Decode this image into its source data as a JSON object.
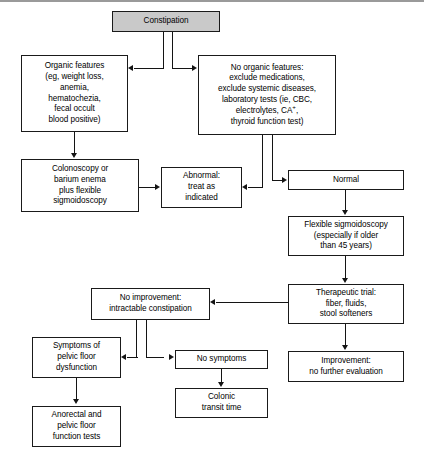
{
  "diagram": {
    "nodes": {
      "constipation": "Constipation",
      "organic_features": "Organic features\n(eg, weight loss,\nanemia,\nhematochezia,\nfecal occult\nblood positive)",
      "no_organic_features_l1": "No organic features:",
      "no_organic_features_l2": "exclude medications,",
      "no_organic_features_l3": "exclude systemic diseases,",
      "no_organic_features_l4": "laboratory tests (ie, CBC,",
      "no_organic_features_l5a": "electrolytes, CA",
      "no_organic_features_l5b": "+",
      "no_organic_features_l5c": ",",
      "no_organic_features_l6": "thyroid function test)",
      "colonoscopy": "Colonoscopy or\nbarium enema\nplus flexible\nsigmoidoscopy",
      "abnormal": "Abnormal:\ntreat as\nindicated",
      "normal": "Normal",
      "flexible_sigmoidoscopy": "Flexible sigmoidoscopy\n(especially if older\nthan 45 years)",
      "therapeutic_trial": "Therapeutic trial:\nfiber, fluids,\nstool softeners",
      "improvement": "Improvement:\nno further evaluation",
      "no_improvement": "No improvement:\nintractable constipation",
      "symptoms_pelvic": "Symptoms of\npelvic floor\ndysfunction",
      "no_symptoms": "No symptoms",
      "anorectal_tests": "Anorectal and\npelvic floor\nfunction tests",
      "colonic_transit": "Colonic\ntransit time"
    },
    "colors": {
      "box_fill": "#ffffff",
      "box_stroke": "#1a1a1a",
      "shaded_fill": "#c9c9c9",
      "connector": "#141414",
      "page_background": "#ffffff",
      "top_rule": "#9a9a9a"
    }
  }
}
